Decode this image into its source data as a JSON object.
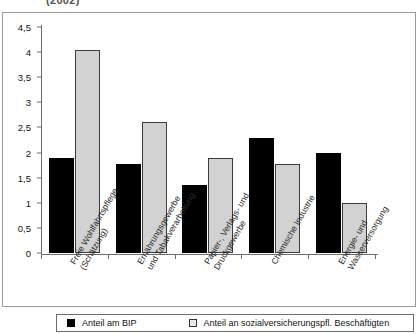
{
  "chart_data": {
    "type": "bar",
    "title": "(2002)",
    "xlabel": "",
    "ylabel": "",
    "ylim": [
      0,
      4.5
    ],
    "ytick_labels": [
      "4,5",
      "4",
      "3,5",
      "3",
      "2,5",
      "2",
      "1,5",
      "1",
      "0,5",
      "0"
    ],
    "ytick_values": [
      4.5,
      4,
      3.5,
      3,
      2.5,
      2,
      1.5,
      1,
      0.5,
      0
    ],
    "grid": false,
    "legend_position": "bottom",
    "categories": [
      "Freie Wohlfahrtspflege\n(Schätzung)",
      "Ernährungsgewerbe\nund Tabakverarbeitung",
      "Papier-, Verlags- und\nDruckgewerbe",
      "Chemische Industrie",
      "Energie- und\nWasserversorgung"
    ],
    "category_lines": [
      [
        "Freie Wohlfahrtspflege",
        "(Schätzung)"
      ],
      [
        "Ernährungsgewerbe",
        "und Tabakverarbeitung"
      ],
      [
        "Papier-, Verlags- und",
        "Druckgewerbe"
      ],
      [
        "Chemische Industrie",
        ""
      ],
      [
        "Energie- und",
        "Wasserversorgung"
      ]
    ],
    "series": [
      {
        "name": "Anteil am BIP",
        "color": "#000000",
        "values": [
          1.9,
          1.77,
          1.35,
          2.3,
          2.0
        ]
      },
      {
        "name": "Anteil an sozialversicherungspfl. Beschäftigten",
        "color": "#d2d2d2",
        "values": [
          4.05,
          2.6,
          1.9,
          1.77,
          1.0
        ]
      }
    ]
  },
  "legend": {
    "items": [
      {
        "label": "Anteil am BIP",
        "swatch": "black-square-icon"
      },
      {
        "label": "Anteil an sozialversicherungspfl. Beschäftigten",
        "swatch": "gray-square-icon"
      }
    ]
  }
}
